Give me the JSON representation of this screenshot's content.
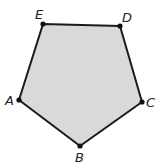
{
  "figure": {
    "shape": "pentagon",
    "fill_color": "#d9d9d9",
    "stroke_color": "#1a1a1a",
    "vertices": [
      {
        "label": "A",
        "x": 19,
        "y": 100
      },
      {
        "label": "B",
        "x": 80,
        "y": 146
      },
      {
        "label": "C",
        "x": 142,
        "y": 102
      },
      {
        "label": "D",
        "x": 120,
        "y": 26
      },
      {
        "label": "E",
        "x": 43,
        "y": 24
      }
    ]
  }
}
